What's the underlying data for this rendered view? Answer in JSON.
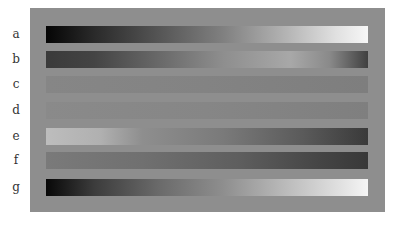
{
  "figure": {
    "background": "#8e8e8e",
    "rows": [
      {
        "label": "a",
        "description": "black to white linear gradient",
        "gradient": "linear-gradient(to right, #050505 0%, #2a2a2a 15%, #555 35%, #808080 55%, #b5b5b5 75%, #e0e0e0 90%, #f7f7f7 100%)"
      },
      {
        "label": "b",
        "description": "dark to light center to dark gradient",
        "gradient": "linear-gradient(to right, #3a3a3a 0%, #444 15%, #6e6e6e 38%, #8e8e8e 55%, #a8a8a8 76%, #8a8a8a 88%, #404040 100%)"
      },
      {
        "label": "c",
        "description": "near-uniform mid gray",
        "gradient": "linear-gradient(to right, #868686 0%, #838383 50%, #7e7e7e 100%)"
      },
      {
        "label": "d",
        "description": "near-uniform mid gray",
        "gradient": "linear-gradient(to right, #8a8a8a 0%, #868686 50%, #7f7f7f 100%)"
      },
      {
        "label": "e",
        "description": "light to dark gradient",
        "gradient": "linear-gradient(to right, #bdbdbd 0%, #b0b0b0 17%, #8e8e8e 30%, #7a7a7a 55%, #5a5a5a 80%, #3a3a3a 100%)"
      },
      {
        "label": "f",
        "description": "mid gray to dark gradient",
        "gradient": "linear-gradient(to right, #7a7a7a 0%, #707070 30%, #5e5e5e 60%, #454545 85%, #383838 100%)"
      },
      {
        "label": "g",
        "description": "black to white linear gradient",
        "gradient": "linear-gradient(to right, #080808 0%, #3c3c3c 15%, #6a6a6a 35%, #8e8e8e 55%, #bcbcbc 75%, #e2e2e2 92%, #f5f5f5 100%)"
      }
    ]
  }
}
